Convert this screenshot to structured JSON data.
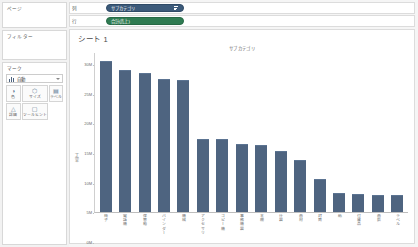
{
  "cards": {
    "pages": {
      "title": "ページ"
    },
    "filters": {
      "title": "フィルター"
    },
    "marks": {
      "title": "マーク",
      "mark_type": "自動",
      "buttons": [
        {
          "name": "color",
          "label": "色",
          "glyph": "◑"
        },
        {
          "name": "size",
          "label": "サイズ",
          "glyph": "⬡"
        },
        {
          "name": "label",
          "label": "ラベル",
          "glyph": "▤"
        },
        {
          "name": "detail",
          "label": "詳細",
          "glyph": "△"
        },
        {
          "name": "tooltip",
          "label": "ツールヒント",
          "glyph": "▢"
        }
      ]
    }
  },
  "shelves": {
    "columns": {
      "label": "列",
      "pill": "サブカテゴリ",
      "pill_type": "dimension",
      "sorted": true
    },
    "rows": {
      "label": "行",
      "pill": "合計(売上)",
      "pill_type": "measure",
      "sorted": false
    }
  },
  "sheet": {
    "title": "シート 1",
    "column_header": "サブカテゴリ"
  },
  "colors": {
    "bar": "#4e6480",
    "dimension_pill": "#3c5a7a",
    "measure_pill": "#2f7b52"
  },
  "chart_data": {
    "type": "bar",
    "title": "シート 1",
    "xlabel": "サブカテゴリ",
    "ylabel": "売上",
    "ylim": [
      0,
      32000000
    ],
    "ytick_labels": [
      "30M",
      "25M",
      "20M",
      "15M",
      "10M",
      "5M",
      "0M"
    ],
    "ytick_values": [
      30000000,
      25000000,
      20000000,
      15000000,
      10000000,
      5000000,
      0
    ],
    "grid": false,
    "legend": "none",
    "categories": [
      "椅子",
      "電話機",
      "保管箱",
      "バインダー",
      "機械",
      "アクセサリ",
      "コピー機",
      "事務機器",
      "本棚",
      "什器",
      "画材",
      "封筒",
      "紙",
      "付属品",
      "画鋲",
      "ラベル"
    ],
    "values": [
      30100000,
      28300000,
      27700000,
      26500000,
      26400000,
      14500000,
      14400000,
      13400000,
      13300000,
      12000000,
      10300000,
      6400000,
      3700000,
      3400000,
      3300000,
      3200000
    ],
    "value_unit": "円",
    "series": [
      {
        "name": "合計(売上)",
        "values": [
          30100000,
          28300000,
          27700000,
          26500000,
          26400000,
          14500000,
          14400000,
          13400000,
          13300000,
          12000000,
          10300000,
          6400000,
          3700000,
          3400000,
          3300000,
          3200000
        ]
      }
    ]
  }
}
